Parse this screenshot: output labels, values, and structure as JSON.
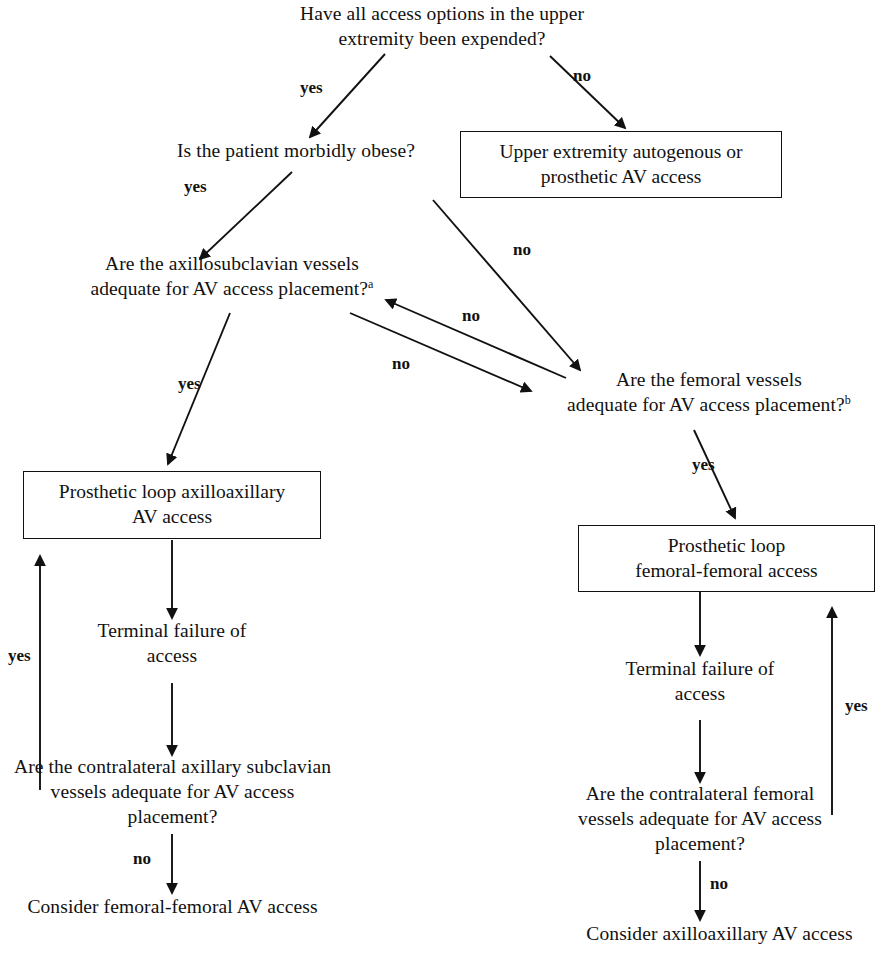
{
  "diagram": {
    "type": "flowchart",
    "line_color": "#111111",
    "background_color": "#ffffff",
    "nodes": [
      {
        "id": "q-upper-expended",
        "shape": "text",
        "line1": "Have all access options in the upper",
        "line2": "extremity been expended?"
      },
      {
        "id": "q-morbidly-obese",
        "shape": "text",
        "line1": "Is the patient morbidly obese?"
      },
      {
        "id": "box-upper-extremity",
        "shape": "box",
        "line1": "Upper extremity autogenous or",
        "line2": "prosthetic AV access"
      },
      {
        "id": "q-axillosubclavian",
        "shape": "text",
        "line1": "Are the axillosubclavian vessels",
        "line2": "adequate for AV access placement?",
        "sup": "a"
      },
      {
        "id": "q-femoral",
        "shape": "text",
        "line1": "Are the femoral vessels",
        "line2": "adequate for AV access placement?",
        "sup": "b"
      },
      {
        "id": "box-axilloaxillary",
        "shape": "box",
        "line1": "Prosthetic loop axilloaxillary",
        "line2": "AV access"
      },
      {
        "id": "box-femoral-femoral",
        "shape": "box",
        "line1": "Prosthetic loop",
        "line2": "femoral-femoral access"
      },
      {
        "id": "terminal-failure-left",
        "shape": "text",
        "line1": "Terminal failure of",
        "line2": "access"
      },
      {
        "id": "terminal-failure-right",
        "shape": "text",
        "line1": "Terminal failure of",
        "line2": "access"
      },
      {
        "id": "q-contralateral-axillary",
        "shape": "text",
        "line1": "Are the contralateral axillary subclavian",
        "line2": "vessels adequate for AV access",
        "line3": "placement?"
      },
      {
        "id": "q-contralateral-femoral",
        "shape": "text",
        "line1": "Are the contralateral femoral",
        "line2": "vessels adequate for AV access",
        "line3": "placement?"
      },
      {
        "id": "outcome-consider-femoral",
        "shape": "text",
        "line1": "Consider femoral-femoral AV access"
      },
      {
        "id": "outcome-consider-axilloaxillary",
        "shape": "text",
        "line1": "Consider axilloaxillary AV access"
      }
    ],
    "edge_labels": {
      "top_yes": "yes",
      "top_no": "no",
      "obese_yes": "yes",
      "obese_no": "no",
      "axillo_yes": "yes",
      "axillo_no": "no",
      "femoral_no": "no",
      "femoral_yes": "yes",
      "left_loop_yes": "yes",
      "right_loop_yes": "yes",
      "left_contra_no": "no",
      "right_contra_no": "no"
    }
  }
}
